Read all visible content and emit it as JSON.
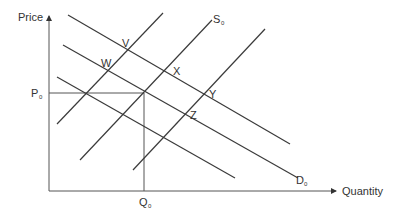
{
  "diagram": {
    "type": "supply-demand",
    "axes": {
      "y_label": "Price",
      "x_label": "Quantity"
    },
    "equilibrium": {
      "price_label": "P",
      "price_sub": "0",
      "quantity_label": "Q",
      "quantity_sub": "0"
    },
    "curves": {
      "supply_label": "S",
      "supply_sub": "0",
      "demand_label": "D",
      "demand_sub": "0"
    },
    "points": {
      "v": "V",
      "w": "W",
      "x": "X",
      "y": "Y",
      "z": "Z"
    },
    "colors": {
      "line": "#3a3a3a",
      "text": "#333333",
      "background": "#ffffff"
    }
  }
}
